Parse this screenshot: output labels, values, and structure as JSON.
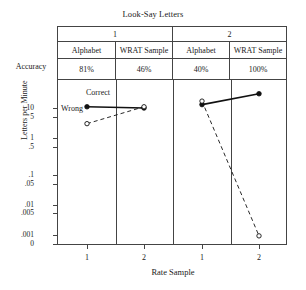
{
  "chart_data": {
    "type": "line",
    "title": "Look-Say Letters",
    "xlabel": "Rate Sample",
    "ylabel": "Letters per Minute",
    "grid": false,
    "legend_position": "inline-annotation",
    "yscale": "log",
    "ytick_labels": [
      "10",
      "5",
      "1",
      ".5",
      ".1",
      ".05",
      ".01",
      ".005",
      ".001",
      "0"
    ],
    "ytick_values": [
      10,
      5,
      1,
      0.5,
      0.1,
      0.05,
      0.01,
      0.005,
      0.001,
      0
    ],
    "xtick_labels": [
      "1",
      "2",
      "1",
      "2"
    ],
    "panels": [
      {
        "group_label": "1",
        "columns": [
          {
            "label": "Alphabet",
            "accuracy": "81%"
          },
          {
            "label": "WRAT Sample",
            "accuracy": "46%"
          }
        ]
      },
      {
        "group_label": "2",
        "columns": [
          {
            "label": "Alphabet",
            "accuracy": "40%"
          },
          {
            "label": "WRAT Sample",
            "accuracy": "100%"
          }
        ]
      }
    ],
    "series": [
      {
        "name": "Correct",
        "marker": "filled-circle",
        "line": "solid",
        "values": [
          11,
          10,
          13,
          30
        ]
      },
      {
        "name": "Wrong",
        "marker": "open-circle",
        "line": "dashed",
        "values": [
          3,
          11,
          17,
          0.0008
        ]
      }
    ],
    "annotations": [
      {
        "text": "Correct",
        "series": "Correct"
      },
      {
        "text": "Wrong",
        "series": "Wrong"
      }
    ],
    "row_labels": [
      "Accuracy"
    ]
  },
  "axis": {
    "row_label_accuracy": "Accuracy"
  }
}
